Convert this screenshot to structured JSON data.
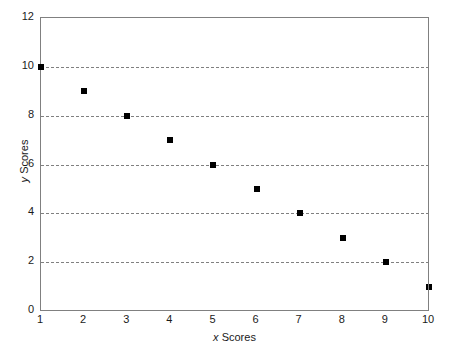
{
  "chart_data": {
    "type": "scatter",
    "title": "",
    "subtitle": "",
    "xlabel": "x Scores",
    "ylabel": "y Scores",
    "xlabel_var": "x",
    "xlabel_text": "Scores",
    "ylabel_var": "y",
    "ylabel_text": "Scores",
    "xlim": [
      1,
      10
    ],
    "ylim": [
      0,
      12
    ],
    "xticks": [
      1,
      2,
      3,
      4,
      5,
      6,
      7,
      8,
      9,
      10
    ],
    "yticks": [
      0,
      2,
      4,
      6,
      8,
      10,
      12
    ],
    "gridlines_y": [
      2,
      4,
      6,
      8,
      10
    ],
    "grid": "horizontal-dashed",
    "legend": "none",
    "marker": "filled-square",
    "marker_color": "#000000",
    "grid_color": "#808080",
    "axis_color": "#808080",
    "background": "#ffffff",
    "x": [
      1,
      2,
      3,
      4,
      5,
      6,
      7,
      8,
      9,
      10
    ],
    "y": [
      10,
      9,
      8,
      7,
      6,
      5,
      4,
      3,
      2,
      1
    ],
    "points": [
      {
        "x": 1,
        "y": 10
      },
      {
        "x": 2,
        "y": 9
      },
      {
        "x": 3,
        "y": 8
      },
      {
        "x": 4,
        "y": 7
      },
      {
        "x": 5,
        "y": 6
      },
      {
        "x": 6,
        "y": 5
      },
      {
        "x": 7,
        "y": 4
      },
      {
        "x": 8,
        "y": 3
      },
      {
        "x": 9,
        "y": 2
      },
      {
        "x": 10,
        "y": 1
      }
    ],
    "annotations": []
  }
}
